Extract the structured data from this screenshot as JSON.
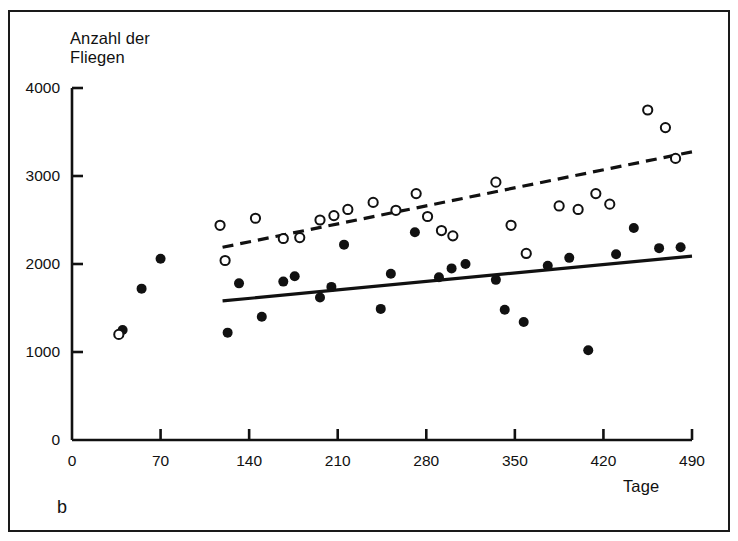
{
  "figure": {
    "panel_label": "b",
    "background_color": "#ffffff",
    "border_color": "#1a1a1a"
  },
  "chart_data": {
    "type": "scatter",
    "title": "",
    "xlabel": "Tage",
    "ylabel": "Anzahl der\nFliegen",
    "ylabel_line1": "Anzahl der",
    "ylabel_line2": "Fliegen",
    "xlim": [
      0,
      500
    ],
    "ylim": [
      0,
      4000
    ],
    "xticks": [
      0,
      70,
      140,
      210,
      280,
      350,
      420,
      490
    ],
    "yticks": [
      0,
      1000,
      2000,
      3000,
      4000
    ],
    "xtick_labels": [
      "0",
      "70",
      "140",
      "210",
      "280",
      "350",
      "420",
      "490"
    ],
    "ytick_labels": [
      "0",
      "1000",
      "2000",
      "3000",
      "4000"
    ],
    "grid": false,
    "legend": "none",
    "marker_color": "#111111",
    "series": [
      {
        "name": "filled-circles",
        "marker": "filled-circle",
        "color": "#111111",
        "points": [
          [
            40,
            1250
          ],
          [
            55,
            1720
          ],
          [
            70,
            2060
          ],
          [
            123,
            1220
          ],
          [
            132,
            1780
          ],
          [
            150,
            1400
          ],
          [
            167,
            1800
          ],
          [
            176,
            1860
          ],
          [
            196,
            1620
          ],
          [
            205,
            1740
          ],
          [
            215,
            2220
          ],
          [
            244,
            1490
          ],
          [
            252,
            1890
          ],
          [
            271,
            2360
          ],
          [
            290,
            1850
          ],
          [
            300,
            1950
          ],
          [
            311,
            2000
          ],
          [
            335,
            1820
          ],
          [
            342,
            1480
          ],
          [
            357,
            1340
          ],
          [
            376,
            1980
          ],
          [
            393,
            2070
          ],
          [
            408,
            1020
          ],
          [
            430,
            2110
          ],
          [
            444,
            2410
          ],
          [
            464,
            2180
          ],
          [
            481,
            2190
          ]
        ]
      },
      {
        "name": "open-circles",
        "marker": "open-circle",
        "color": "#111111",
        "points": [
          [
            37,
            1200
          ],
          [
            117,
            2440
          ],
          [
            121,
            2040
          ],
          [
            145,
            2520
          ],
          [
            167,
            2290
          ],
          [
            180,
            2300
          ],
          [
            196,
            2500
          ],
          [
            207,
            2550
          ],
          [
            218,
            2620
          ],
          [
            238,
            2700
          ],
          [
            256,
            2610
          ],
          [
            272,
            2800
          ],
          [
            281,
            2540
          ],
          [
            292,
            2380
          ],
          [
            301,
            2320
          ],
          [
            335,
            2930
          ],
          [
            347,
            2440
          ],
          [
            359,
            2120
          ],
          [
            385,
            2660
          ],
          [
            400,
            2620
          ],
          [
            414,
            2800
          ],
          [
            425,
            2680
          ],
          [
            455,
            3750
          ],
          [
            469,
            3550
          ],
          [
            477,
            3200
          ]
        ]
      }
    ],
    "trend_lines": [
      {
        "name": "solid-trend-line",
        "style": "solid",
        "color": "#111111",
        "x_start": 119,
        "y_start": 1580,
        "x_end": 490,
        "y_end": 2090
      },
      {
        "name": "dashed-trend-line",
        "style": "dashed",
        "color": "#111111",
        "x_start": 119,
        "y_start": 2190,
        "x_end": 490,
        "y_end": 3275
      }
    ]
  }
}
